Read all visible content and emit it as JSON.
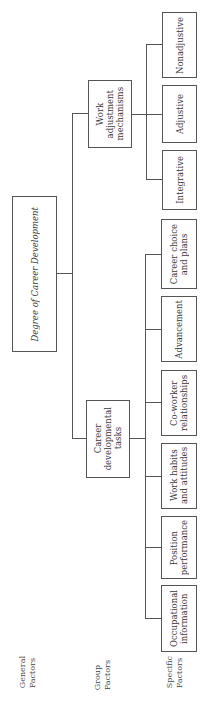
{
  "diagram": {
    "root": "Degree of Career Development",
    "groups": [
      {
        "label": "Work\nadjustment\nmechanisms",
        "children": [
          "Integrative",
          "Adjustive",
          "Nonadjustive"
        ]
      },
      {
        "label": "Career\ndevelopmental\ntasks",
        "children": [
          "Occupational\ninformation",
          "Position\nperformance",
          "Work habits\nand attitudes",
          "Co-worker\nrelationships",
          "Advancement",
          "Career choice\nand plans"
        ]
      }
    ],
    "level_labels": {
      "general": "General\nFactors",
      "group": "Group\nFactors",
      "specific": "Specific\nFactors"
    }
  }
}
